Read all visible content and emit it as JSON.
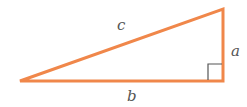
{
  "diagram": {
    "stroke_color": "#f0874a",
    "marker_color": "#555555",
    "labels": {
      "hypotenuse": "c",
      "vertical_leg": "a",
      "horizontal_leg": "b"
    }
  }
}
